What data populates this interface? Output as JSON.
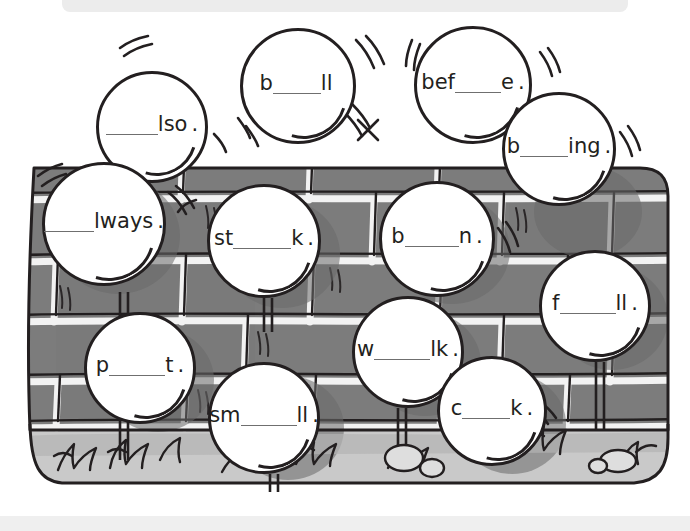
{
  "page": {
    "top_bar": {
      "tick": ""
    },
    "bottom_bar": {
      "label": ""
    }
  },
  "scene": {
    "description": "cartoon brick wall with grass, stones and white word bubbles",
    "colors": {
      "ink": "#231f20",
      "brick": "#7c7c7c",
      "brick_shadow": "#6a6a6a",
      "mortar": "#f2f2f2",
      "ground": "#c9c9c9",
      "ground_shadow": "#b4b4b4",
      "bubble_fill": "#ffffff",
      "blank_line": "#6f6f6f",
      "chrome": "#ececec"
    }
  },
  "bubbles": [
    {
      "id": "also",
      "prefix": "",
      "suffix": "lso",
      "blank_width": 52,
      "punct": ".",
      "x": 96,
      "y": 71,
      "size": 112,
      "shine": {
        "w": 74,
        "h": 74,
        "x": 18,
        "y": 22
      }
    },
    {
      "id": "ball",
      "prefix": "b",
      "suffix": "ll",
      "blank_width": 48,
      "punct": "",
      "x": 240,
      "y": 28,
      "size": 116,
      "shine": {
        "w": 80,
        "h": 80,
        "x": 18,
        "y": 22
      }
    },
    {
      "id": "before",
      "prefix": "bef",
      "suffix": "e",
      "blank_width": 46,
      "punct": ".",
      "x": 414,
      "y": 26,
      "size": 118,
      "shine": {
        "w": 82,
        "h": 82,
        "x": 16,
        "y": 22
      }
    },
    {
      "id": "boiling",
      "prefix": "b",
      "suffix": "ing",
      "blank_width": 48,
      "punct": ".",
      "x": 502,
      "y": 92,
      "size": 114,
      "shine": {
        "w": 78,
        "h": 78,
        "x": 18,
        "y": 22
      }
    },
    {
      "id": "always",
      "prefix": "",
      "suffix": "lways",
      "blank_width": 50,
      "punct": ".",
      "x": 42,
      "y": 162,
      "size": 124,
      "shine": {
        "w": 86,
        "h": 86,
        "x": 18,
        "y": 24
      }
    },
    {
      "id": "stalk",
      "prefix": "st",
      "suffix": "k",
      "blank_width": 58,
      "punct": ".",
      "x": 207,
      "y": 184,
      "size": 114,
      "shine": {
        "w": 78,
        "h": 78,
        "x": 18,
        "y": 22
      }
    },
    {
      "id": "brown",
      "prefix": "b",
      "suffix": "n",
      "blank_width": 54,
      "punct": ".",
      "x": 379,
      "y": 181,
      "size": 116,
      "shine": {
        "w": 80,
        "h": 80,
        "x": 18,
        "y": 22
      }
    },
    {
      "id": "fall",
      "prefix": "f",
      "suffix": "ll",
      "blank_width": 56,
      "punct": ".",
      "x": 539,
      "y": 250,
      "size": 112,
      "shine": {
        "w": 76,
        "h": 76,
        "x": 18,
        "y": 22
      }
    },
    {
      "id": "walk",
      "prefix": "w",
      "suffix": "lk",
      "blank_width": 56,
      "punct": ".",
      "x": 352,
      "y": 296,
      "size": 112,
      "shine": {
        "w": 76,
        "h": 76,
        "x": 18,
        "y": 22
      }
    },
    {
      "id": "part",
      "prefix": "p",
      "suffix": "t",
      "blank_width": 56,
      "punct": ".",
      "x": 84,
      "y": 312,
      "size": 112,
      "shine": {
        "w": 76,
        "h": 76,
        "x": 18,
        "y": 22
      }
    },
    {
      "id": "small",
      "prefix": "sm",
      "suffix": "ll",
      "blank_width": 56,
      "punct": ".",
      "x": 208,
      "y": 362,
      "size": 112,
      "shine": {
        "w": 76,
        "h": 76,
        "x": 18,
        "y": 22
      }
    },
    {
      "id": "chalk",
      "prefix": "c",
      "suffix": "k",
      "blank_width": 48,
      "punct": ".",
      "x": 437,
      "y": 356,
      "size": 110,
      "shine": {
        "w": 74,
        "h": 74,
        "x": 18,
        "y": 22
      }
    }
  ]
}
